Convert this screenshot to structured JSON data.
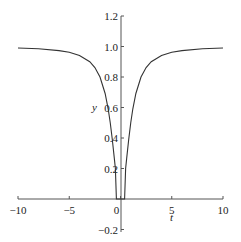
{
  "chart_data": {
    "type": "line",
    "title": "",
    "xlabel": "t",
    "ylabel": "y",
    "xlim": [
      -10,
      10
    ],
    "ylim": [
      -0.2,
      1.2
    ],
    "grid": false,
    "legend": null,
    "x_ticks": [
      -10,
      -5,
      0,
      5,
      10
    ],
    "x_tick_labels": [
      "−10",
      "−5",
      "0",
      "5",
      "10"
    ],
    "y_ticks": [
      -0.2,
      0.2,
      0.4,
      0.6,
      0.8,
      1.0,
      1.2
    ],
    "y_tick_labels": [
      "−0.2",
      "0.2",
      "0.4",
      "0.6",
      "0.8",
      "1.0",
      "1.2"
    ],
    "series": [
      {
        "name": "y(t)",
        "color": "#333333",
        "x": [
          -10,
          -8,
          -6,
          -5,
          -4,
          -3,
          -2.5,
          -2,
          -1.5,
          -1.2,
          -1,
          -0.8,
          -0.6,
          -0.5,
          -0.4,
          0.4,
          0.5,
          0.6,
          0.8,
          1,
          1.2,
          1.5,
          2,
          2.5,
          3,
          4,
          5,
          6,
          8,
          10
        ],
        "values": [
          0.99,
          0.985,
          0.973,
          0.962,
          0.941,
          0.9,
          0.862,
          0.8,
          0.692,
          0.59,
          0.5,
          0.39,
          0.265,
          0.2,
          0.0,
          0.0,
          0.2,
          0.265,
          0.39,
          0.5,
          0.59,
          0.692,
          0.8,
          0.862,
          0.9,
          0.941,
          0.962,
          0.973,
          0.985,
          0.99
        ]
      }
    ]
  },
  "axes": {
    "x_label": "t",
    "y_label": "y"
  }
}
